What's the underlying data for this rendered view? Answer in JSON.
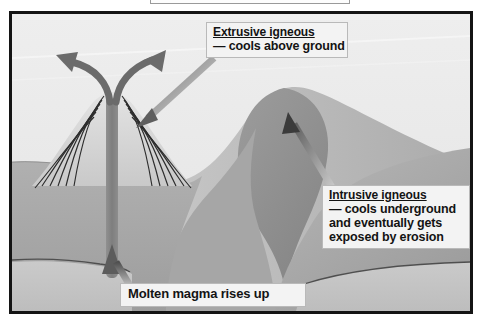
{
  "diagram": {
    "type": "geology-cross-section",
    "background_color": "#e9e9e9",
    "border_color": "#141414"
  },
  "labels": {
    "extrusive": {
      "heading": "Extrusive igneous",
      "description": "— cools above ground"
    },
    "intrusive": {
      "heading": "Intrusive igneous",
      "line1": "— cools underground",
      "line2": "and eventually gets",
      "line3": "exposed by erosion"
    },
    "magma": {
      "text": "Molten magma rises up"
    }
  },
  "features": {
    "volcano": "stratovolcano with layered strata",
    "conduit": "vertical magma conduit",
    "eruption_arrows": "two curved arrows from vent",
    "pluton": "teardrop shaped intrusive body",
    "hill": "eroded hill exposing pluton",
    "ground_layer": "#a8a8a8",
    "bedrock_layer": "#c2c2c2",
    "sky_color": "#ececec",
    "magma_color": "#8a8a8a",
    "pluton_color": "#8e8e8e"
  }
}
